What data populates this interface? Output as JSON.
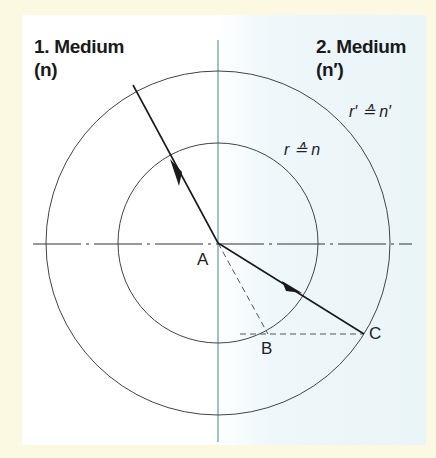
{
  "media": {
    "medium1": {
      "line1": "1. Medium",
      "line2": "(n)"
    },
    "medium2": {
      "line1": "2. Medium",
      "line2": "(n′)"
    }
  },
  "labels": {
    "inner_radius": "r ≙ n",
    "outer_radius": "r′ ≙ n′",
    "point_a": "A",
    "point_b": "B",
    "point_c": "C"
  },
  "colors": {
    "frame": "#fcf9e3",
    "line": "#333333",
    "normal_axis": "#8fb0c6",
    "medium2_tint": "#eaf5f8"
  },
  "geometry": {
    "center": [
      218,
      243
    ],
    "inner_radius": 100,
    "outer_radius": 172,
    "incident_start": [
      133,
      85
    ],
    "point_b": [
      268,
      334
    ],
    "point_c": [
      364,
      334
    ]
  }
}
